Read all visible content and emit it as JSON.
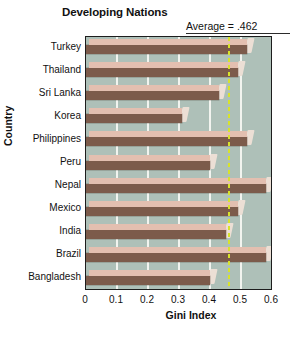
{
  "chart_data": {
    "type": "bar",
    "orientation": "horizontal",
    "title": "Developing Nations",
    "xlabel": "Gini Index",
    "ylabel": "Country",
    "xlim": [
      0,
      0.6
    ],
    "xticks": [
      "0",
      "0.1",
      "0.2",
      "0.3",
      "0.4",
      "0.5",
      "0.6"
    ],
    "xtick_values": [
      0,
      0.1,
      0.2,
      0.3,
      0.4,
      0.5,
      0.6
    ],
    "grid": true,
    "legend": "none",
    "categories": [
      "Turkey",
      "Thailand",
      "Sri Lanka",
      "Korea",
      "Philippines",
      "Peru",
      "Nepal",
      "Mexico",
      "India",
      "Brazil",
      "Bangladesh"
    ],
    "values": [
      0.52,
      0.49,
      0.43,
      0.31,
      0.52,
      0.4,
      0.58,
      0.49,
      0.45,
      0.58,
      0.4
    ],
    "annotations": [
      {
        "name": "average-line",
        "label": "Average = .462",
        "value": 0.462,
        "style": "dashed-vertical",
        "color": "#d8e32a"
      }
    ],
    "colors": {
      "bar_front": "#7c5b4b",
      "bar_top": "#e3bfb0",
      "bar_cap": "#ecdfd5",
      "plot_background": "#aec0b8",
      "gridline": "#f2f4ef",
      "frame": "#1d1d1d",
      "average_line": "#d8e32a",
      "text": "#111111"
    }
  }
}
